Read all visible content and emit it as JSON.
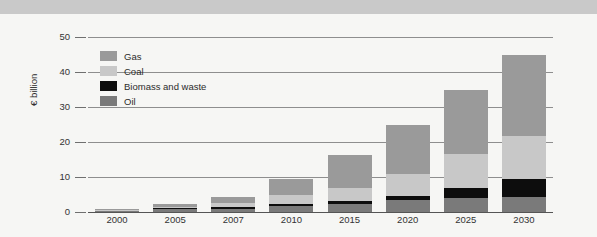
{
  "figure": {
    "source_note": "Source: EWEA (2008a)"
  },
  "legend": {
    "items": [
      {
        "label": "Gas",
        "color": "#9a9a9a",
        "key": "gas"
      },
      {
        "label": "Coal",
        "color": "#c8c8c8",
        "key": "coal"
      },
      {
        "label": "Biomass and waste",
        "color": "#0d0d0d",
        "key": "biomass"
      },
      {
        "label": "Oil",
        "color": "#7a7a7a",
        "key": "oil"
      }
    ]
  },
  "chart_data": {
    "type": "bar",
    "stacked": true,
    "title": "",
    "xlabel": "",
    "ylabel": "€ billion",
    "ylim": [
      0,
      52
    ],
    "yticks": [
      0,
      10,
      20,
      30,
      40,
      50
    ],
    "ytick_labels": [
      "0",
      "10",
      "20",
      "30",
      "40",
      "50"
    ],
    "grid": true,
    "legend_position": "inside-upper-left",
    "categories": [
      "2000",
      "2005",
      "2007",
      "2010",
      "2015",
      "2020",
      "2025",
      "2030"
    ],
    "series": [
      {
        "name": "Oil",
        "color": "#7a7a7a",
        "values": [
          0.3,
          0.8,
          1.0,
          1.8,
          2.4,
          3.4,
          3.9,
          4.4
        ]
      },
      {
        "name": "Biomass and waste",
        "color": "#0d0d0d",
        "values": [
          0.1,
          0.3,
          0.4,
          0.4,
          0.7,
          1.1,
          3.0,
          4.9
        ]
      },
      {
        "name": "Coal",
        "color": "#c8c8c8",
        "values": [
          0.1,
          0.4,
          1.1,
          2.7,
          3.9,
          6.3,
          9.8,
          12.5
        ]
      },
      {
        "name": "Gas",
        "color": "#9a9a9a",
        "values": [
          0.1,
          0.8,
          1.8,
          4.6,
          9.3,
          14.2,
          18.3,
          23.2
        ]
      }
    ],
    "totals": [
      0.6,
      2.3,
      4.3,
      9.5,
      16.3,
      25.0,
      35.0,
      45.0
    ]
  }
}
